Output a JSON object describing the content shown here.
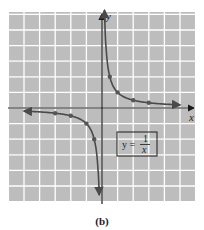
{
  "chart_data": {
    "type": "line",
    "title": "",
    "caption": "(b)",
    "xlabel": "x",
    "ylabel": "y",
    "xlim": [
      -6,
      6
    ],
    "ylim": [
      -6,
      6
    ],
    "grid": true,
    "legend": {
      "text_lhs": "y =",
      "numerator": "1",
      "denominator": "x",
      "position": "lower right quadrant"
    },
    "series": [
      {
        "name": "y = 1/x (x > 0)",
        "points": [
          [
            0.5,
            2
          ],
          [
            1,
            1
          ],
          [
            2,
            0.5
          ],
          [
            3,
            0.333
          ]
        ],
        "curve_range": [
          0.16,
          5
        ]
      },
      {
        "name": "y = 1/x (x < 0)",
        "points": [
          [
            -3,
            -0.333
          ],
          [
            -2,
            -0.5
          ],
          [
            -1,
            -1
          ],
          [
            -0.5,
            -2
          ]
        ],
        "curve_range": [
          -5,
          -0.18
        ]
      }
    ],
    "colors": {
      "background": "#bdbdbd",
      "grid": "#ffffff",
      "axis": "#1a1a1a",
      "curve": "#4a4a4a",
      "point": "#555555"
    }
  }
}
